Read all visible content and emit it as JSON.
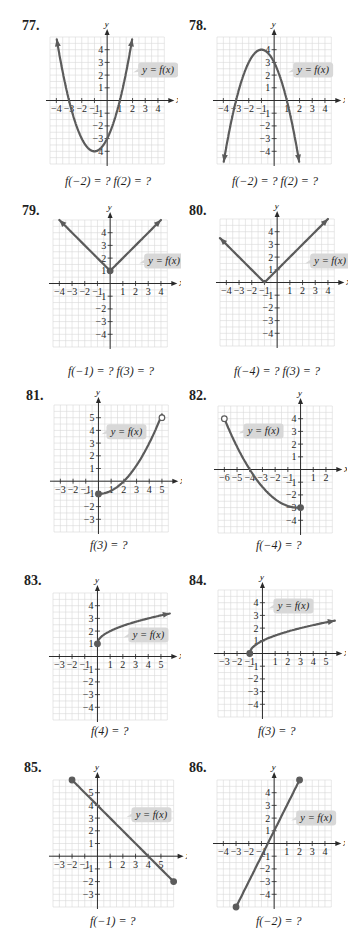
{
  "colors": {
    "curve": "#5b5b5b",
    "grid": "#d9d9d9",
    "axis": "#2a2a2a",
    "label_bg": "#d8d8d8",
    "text": "#1f1f1f"
  },
  "chart_data": [
    {
      "id": "77",
      "number": "77.",
      "type": "line",
      "title": "77.",
      "xlabel": "x",
      "ylabel": "y",
      "label": "y = f(x)",
      "caption": "f(−2) = ?  f(2) = ?",
      "xlim": [
        -4.5,
        4.5
      ],
      "ylim": [
        -5,
        5
      ],
      "xticks": [
        -4,
        -3,
        -2,
        -1,
        1,
        2,
        3,
        4
      ],
      "yticks": [
        -4,
        -3,
        -2,
        -1,
        1,
        2,
        3,
        4
      ],
      "description": "Upward parabola, vertex (-1,-4), zeros at x=-3 and x=1, y-intercept -3, arrows at both ends",
      "fn": "parabola",
      "params": {
        "a": 1,
        "h": -1,
        "k": -4
      },
      "domain": [
        -4,
        2
      ],
      "arrows": [
        "start",
        "end"
      ],
      "grid": true,
      "frame": {
        "x": 42,
        "y": 33
      },
      "label_pos": {
        "x": 138,
        "y": 62
      },
      "caption_pos": {
        "x": 65,
        "y": 176
      },
      "origin": {
        "x": 107,
        "y": 100
      }
    },
    {
      "id": "78",
      "number": "78.",
      "type": "line",
      "title": "78.",
      "xlabel": "x",
      "ylabel": "y",
      "label": "y = f(x)",
      "caption": "f(−2) = ?  f(2) = ?",
      "xlim": [
        -4.5,
        4.5
      ],
      "ylim": [
        -5,
        5
      ],
      "xticks": [
        -4,
        -3,
        -2,
        -1,
        1,
        2,
        3,
        4
      ],
      "yticks": [
        -4,
        -3,
        -2,
        -1,
        1,
        2,
        3,
        4
      ],
      "description": "Downward parabola, vertex (-1,4), zeros at x=-3 and x=1, y-intercept 3, arrows at both ends",
      "fn": "parabola",
      "params": {
        "a": -1,
        "h": -1,
        "k": 4
      },
      "domain": [
        -4,
        2
      ],
      "arrows": [
        "start",
        "end"
      ],
      "grid": true,
      "frame": {
        "x": 209,
        "y": 33
      },
      "label_pos": {
        "x": 293,
        "y": 62
      },
      "caption_pos": {
        "x": 232,
        "y": 176
      },
      "origin": {
        "x": 274,
        "y": 100
      }
    },
    {
      "id": "79",
      "number": "79.",
      "type": "line",
      "title": "79.",
      "xlabel": "x",
      "ylabel": "y",
      "label": "y = f(x)",
      "caption": "f(−1) = ?  f(3) = ?",
      "xlim": [
        -4.5,
        4.5
      ],
      "ylim": [
        -5,
        5
      ],
      "xticks": [
        -4,
        -3,
        -2,
        -1,
        1,
        2,
        3,
        4
      ],
      "yticks": [
        -4,
        -3,
        -2,
        -1,
        1,
        2,
        3,
        4
      ],
      "description": "V-shape absolute value, vertex (0,1) with closed dot, arrows on both arms",
      "fn": "abs",
      "params": {
        "h": 0,
        "k": 1
      },
      "domain": [
        -4,
        4
      ],
      "arrows": [
        "start",
        "end"
      ],
      "dots": [
        {
          "x": 0,
          "y": 1,
          "filled": true
        }
      ],
      "grid": true,
      "frame": {
        "x": 42,
        "y": 218
      },
      "label_pos": {
        "x": 144,
        "y": 253
      },
      "caption_pos": {
        "x": 68,
        "y": 366
      },
      "origin": {
        "x": 110,
        "y": 283
      }
    },
    {
      "id": "80",
      "number": "80.",
      "type": "line",
      "title": "80.",
      "xlabel": "x",
      "ylabel": "y",
      "label": "y = f(x)",
      "caption": "f(−4) = ?  f(3) = ?",
      "xlim": [
        -4.5,
        4.5
      ],
      "ylim": [
        -5,
        5
      ],
      "xticks": [
        -4,
        -3,
        -2,
        -1,
        1,
        2,
        3,
        4
      ],
      "yticks": [
        -4,
        -3,
        -2,
        -1,
        1,
        2,
        3,
        4
      ],
      "description": "V-shape absolute value, vertex (-1,0), arrows on both arms",
      "fn": "abs",
      "params": {
        "h": -1,
        "k": 0
      },
      "domain": [
        -4.5,
        4
      ],
      "arrows": [
        "start",
        "end"
      ],
      "grid": true,
      "frame": {
        "x": 214,
        "y": 218
      },
      "label_pos": {
        "x": 310,
        "y": 253
      },
      "caption_pos": {
        "x": 234,
        "y": 366
      },
      "origin": {
        "x": 277,
        "y": 282
      }
    },
    {
      "id": "81",
      "number": "81.",
      "type": "line",
      "title": "81.",
      "xlabel": "x",
      "ylabel": "y",
      "label": "y = f(x)",
      "caption": "f(3) = ?",
      "xlim": [
        -3.5,
        5.5
      ],
      "ylim": [
        -4,
        6
      ],
      "xticks": [
        -3,
        -2,
        -1,
        1,
        2,
        3,
        4,
        5
      ],
      "yticks": [
        -3,
        -2,
        -1,
        1,
        2,
        3,
        4,
        5
      ],
      "description": "Curve y = x^2/4 - 1 from closed dot (0,-1) to open dot (5,5); crosses x-axis at 2",
      "fn": "custom81",
      "domain": [
        0,
        5
      ],
      "arrows": [],
      "dots": [
        {
          "x": 0,
          "y": -1,
          "filled": true
        },
        {
          "x": 5,
          "y": 5,
          "filled": false
        }
      ],
      "grid": true,
      "frame": {
        "x": 47,
        "y": 402
      },
      "label_pos": {
        "x": 106,
        "y": 424
      },
      "caption_pos": {
        "x": 90,
        "y": 540
      },
      "origin": {
        "x": 98,
        "y": 481
      }
    },
    {
      "id": "82",
      "number": "82.",
      "type": "line",
      "title": "82.",
      "xlabel": "x",
      "ylabel": "y",
      "label": "y = f(x)",
      "caption": "f(−4) = ?",
      "xlim": [
        -6.5,
        2.5
      ],
      "ylim": [
        -5,
        5
      ],
      "xticks": [
        -6,
        -5,
        -4,
        -3,
        -2,
        -1,
        1,
        2
      ],
      "yticks": [
        -4,
        -3,
        -2,
        -1,
        1,
        2,
        3,
        4
      ],
      "description": "Decreasing curve from open dot (-6,4) through (-4,0) to closed dot (0,-3)",
      "fn": "custom82",
      "domain": [
        -6,
        0
      ],
      "arrows": [],
      "dots": [
        {
          "x": -6,
          "y": 4,
          "filled": false
        },
        {
          "x": 0,
          "y": -3,
          "filled": true
        }
      ],
      "grid": true,
      "frame": {
        "x": 206,
        "y": 402
      },
      "label_pos": {
        "x": 244,
        "y": 423
      },
      "caption_pos": {
        "x": 256,
        "y": 540
      },
      "origin": {
        "x": 301,
        "y": 469
      }
    },
    {
      "id": "83",
      "number": "83.",
      "type": "line",
      "title": "83.",
      "xlabel": "x",
      "ylabel": "y",
      "label": "y = f(x)",
      "caption": "f(4) = ?",
      "xlim": [
        -3.5,
        5.5
      ],
      "ylim": [
        -5,
        5
      ],
      "xticks": [
        -3,
        -2,
        -1,
        1,
        2,
        3,
        4,
        5
      ],
      "yticks": [
        -4,
        -3,
        -2,
        -1,
        1,
        2,
        3,
        4
      ],
      "description": "Square-root type curve y = sqrt(x) + 1 starting at closed dot (0,1), arrow on right end",
      "fn": "sqrt",
      "params": {
        "h": 0,
        "k": 1
      },
      "domain": [
        0,
        5.7
      ],
      "arrows": [
        "end"
      ],
      "dots": [
        {
          "x": 0,
          "y": 1,
          "filled": true
        }
      ],
      "grid": true,
      "frame": {
        "x": 44,
        "y": 588
      },
      "label_pos": {
        "x": 128,
        "y": 627
      },
      "caption_pos": {
        "x": 91,
        "y": 726
      },
      "origin": {
        "x": 97,
        "y": 656
      }
    },
    {
      "id": "84",
      "number": "84.",
      "type": "line",
      "title": "84.",
      "xlabel": "x",
      "ylabel": "y",
      "label": "y = f(x)",
      "caption": "f(3) = ?",
      "xlim": [
        -3.5,
        5.5
      ],
      "ylim": [
        -5,
        5
      ],
      "xticks": [
        -3,
        -2,
        -1,
        1,
        2,
        3,
        4,
        5
      ],
      "yticks": [
        -4,
        -3,
        -2,
        -1,
        1,
        2,
        3,
        4
      ],
      "description": "Square-root type curve y = sqrt(x+1) starting at closed dot (-1,0), arrow on right end",
      "fn": "sqrt",
      "params": {
        "h": -1,
        "k": 0
      },
      "domain": [
        -1,
        5.7
      ],
      "arrows": [
        "end"
      ],
      "dots": [
        {
          "x": -1,
          "y": 0,
          "filled": true
        }
      ],
      "grid": true,
      "frame": {
        "x": 211,
        "y": 588
      },
      "label_pos": {
        "x": 273,
        "y": 598
      },
      "caption_pos": {
        "x": 258,
        "y": 726
      },
      "origin": {
        "x": 262,
        "y": 653
      }
    },
    {
      "id": "85",
      "number": "85.",
      "type": "line",
      "title": "85.",
      "xlabel": "x",
      "ylabel": "y",
      "label": "y = f(x)",
      "caption": "f(−1) = ?",
      "xlim": [
        -3.5,
        6
      ],
      "ylim": [
        -4,
        6
      ],
      "xticks": [
        -3,
        -2,
        -1,
        1,
        2,
        3,
        4,
        5
      ],
      "yticks": [
        -3,
        -2,
        -1,
        1,
        2,
        3,
        4,
        5
      ],
      "description": "Line segment y = -x + 4 from closed dot (-2,6) to closed dot (6,-2)",
      "fn": "line",
      "params": {
        "m": -1,
        "b": 4
      },
      "domain": [
        -2,
        6
      ],
      "arrows": [],
      "dots": [
        {
          "x": -2,
          "y": 6,
          "filled": true
        },
        {
          "x": 6,
          "y": -2,
          "filled": true
        }
      ],
      "grid": true,
      "frame": {
        "x": 44,
        "y": 774
      },
      "label_pos": {
        "x": 131,
        "y": 807
      },
      "caption_pos": {
        "x": 90,
        "y": 916
      },
      "origin": {
        "x": 97,
        "y": 856
      }
    },
    {
      "id": "86",
      "number": "86.",
      "type": "line",
      "title": "86.",
      "xlabel": "x",
      "ylabel": "y",
      "label": "y = f(x)",
      "caption": "f(−2) = ?",
      "xlim": [
        -4.5,
        4.5
      ],
      "ylim": [
        -5,
        5
      ],
      "xticks": [
        -4,
        -3,
        -2,
        -1,
        1,
        2,
        3,
        4
      ],
      "yticks": [
        -4,
        -3,
        -2,
        -1,
        1,
        2,
        3,
        4
      ],
      "description": "Line segment y = 2x + 1 from closed dot (-3,-5) to closed dot (2,5)",
      "fn": "line",
      "params": {
        "m": 2,
        "b": 1
      },
      "domain": [
        -3,
        2
      ],
      "arrows": [],
      "dots": [
        {
          "x": -3,
          "y": -5,
          "filled": true
        },
        {
          "x": 2,
          "y": 5,
          "filled": true
        }
      ],
      "grid": true,
      "frame": {
        "x": 209,
        "y": 774
      },
      "label_pos": {
        "x": 296,
        "y": 810
      },
      "caption_pos": {
        "x": 256,
        "y": 916
      },
      "origin": {
        "x": 274,
        "y": 843
      }
    }
  ],
  "layout": {
    "numbers": [
      {
        "text": "77.",
        "x": 22,
        "y": 18
      },
      {
        "text": "78.",
        "x": 189,
        "y": 18
      },
      {
        "text": "79.",
        "x": 22,
        "y": 203
      },
      {
        "text": "80.",
        "x": 189,
        "y": 203
      },
      {
        "text": "81.",
        "x": 26,
        "y": 388
      },
      {
        "text": "82.",
        "x": 189,
        "y": 388
      },
      {
        "text": "83.",
        "x": 24,
        "y": 573
      },
      {
        "text": "84.",
        "x": 189,
        "y": 573
      },
      {
        "text": "85.",
        "x": 24,
        "y": 760
      },
      {
        "text": "86.",
        "x": 189,
        "y": 760
      }
    ]
  }
}
